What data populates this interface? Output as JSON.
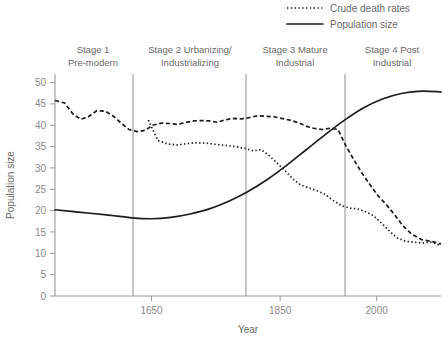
{
  "chart_data": {
    "type": "line",
    "title": "",
    "xlabel": "Year",
    "ylabel": "Population size",
    "xlim": [
      1500,
      2100
    ],
    "ylim": [
      0,
      52
    ],
    "xticks": [
      1650,
      1850,
      2000
    ],
    "yticks": [
      0,
      5,
      10,
      15,
      20,
      25,
      30,
      35,
      40,
      45,
      50
    ],
    "grid": false,
    "legend_position": "top-right",
    "legend": [
      {
        "label": "Crude death rates",
        "style": "dotted"
      },
      {
        "label": "Population size",
        "style": "solid"
      }
    ],
    "stage_dividers": [
      1650,
      1825,
      1975
    ],
    "annotations": [
      {
        "line1": "Stage 1",
        "line2": "Pre-modern"
      },
      {
        "line1": "Stage 2 Urbanizing/",
        "line2": "Industrializing"
      },
      {
        "line1": "Stage 3 Mature",
        "line2": "Industrial"
      },
      {
        "line1": "Stage 4 Post",
        "line2": "Industrial"
      }
    ],
    "series": [
      {
        "name": "Population size",
        "style": "solid",
        "x": [
          1500,
          1540,
          1580,
          1620,
          1650,
          1680,
          1710,
          1740,
          1770,
          1800,
          1830,
          1860,
          1890,
          1920,
          1950,
          1980,
          2010,
          2040,
          2070,
          2100
        ],
        "values": [
          20.2,
          19.6,
          19.0,
          18.3,
          18.1,
          18.4,
          19.2,
          20.4,
          22.2,
          24.5,
          27.3,
          30.6,
          34.2,
          37.8,
          41.2,
          44.1,
          46.2,
          47.5,
          48.0,
          47.8
        ]
      },
      {
        "name": "Crude death rates (upper)",
        "style": "dashed",
        "x": [
          1500,
          1515,
          1528,
          1540,
          1552,
          1565,
          1578,
          1590,
          1602,
          1615,
          1628,
          1640,
          1652,
          1665,
          1678,
          1690,
          1702,
          1715,
          1728,
          1740,
          1752,
          1765,
          1778,
          1790,
          1802,
          1815,
          1828,
          1840,
          1852,
          1865,
          1878,
          1890,
          1902,
          1915,
          1928,
          1940,
          1952,
          1965,
          1978,
          1990,
          2002,
          2015,
          2028,
          2040,
          2055,
          2070,
          2085,
          2100
        ],
        "values": [
          45.8,
          45.2,
          42.6,
          41.4,
          42.0,
          43.4,
          43.3,
          42.2,
          40.6,
          39.0,
          38.5,
          38.8,
          40.0,
          40.5,
          40.4,
          40.2,
          40.6,
          41.0,
          41.1,
          41.0,
          40.7,
          41.3,
          41.6,
          41.5,
          41.8,
          42.2,
          42.1,
          42.0,
          41.6,
          41.2,
          40.6,
          39.8,
          39.3,
          39.0,
          39.3,
          39.0,
          35.2,
          31.8,
          28.6,
          26.0,
          23.5,
          21.4,
          19.0,
          16.6,
          14.4,
          13.2,
          12.8,
          12.2
        ]
      },
      {
        "name": "Crude death rates (lower)",
        "style": "dotted",
        "x": [
          1645,
          1660,
          1675,
          1690,
          1705,
          1720,
          1735,
          1750,
          1765,
          1780,
          1795,
          1808,
          1820,
          1832,
          1845,
          1858,
          1870,
          1882,
          1895,
          1908,
          1920,
          1932,
          1945,
          1958,
          1970,
          1982,
          1995,
          2008,
          2020,
          2032,
          2045,
          2058,
          2070,
          2085,
          2100
        ],
        "values": [
          41.2,
          36.4,
          35.6,
          35.4,
          35.7,
          35.9,
          35.8,
          35.5,
          35.3,
          35.0,
          34.6,
          34.0,
          34.3,
          33.0,
          31.2,
          29.3,
          27.4,
          26.0,
          25.3,
          24.6,
          23.8,
          22.4,
          21.2,
          20.6,
          20.4,
          19.8,
          18.8,
          17.0,
          15.2,
          13.6,
          12.8,
          12.6,
          12.4,
          12.6,
          11.8
        ]
      }
    ]
  }
}
